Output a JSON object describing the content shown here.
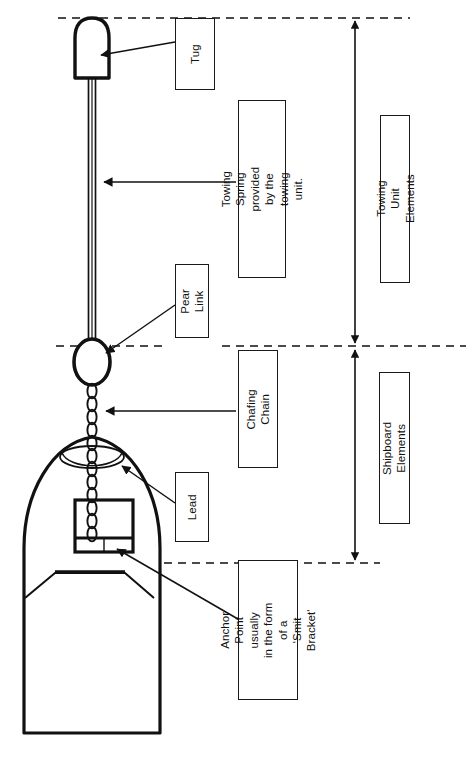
{
  "diagram": {
    "stroke_color": "#111111",
    "background_color": "#ffffff"
  },
  "labels": {
    "tug": "Tug",
    "towing_spring": "Towing Spring provided\nby the towing unit.",
    "towing_unit_elements": "Towing Unit Elements",
    "pear_link": "Pear Link",
    "chafing_chain": "Chafing\nChain",
    "shipboard_elements": "Shipboard Elements",
    "lead": "Lead",
    "anchor_point": "Anchor Point usually\nin the form of a\n'Smit Bracket'"
  },
  "parts": {
    "tug_hull": "tug-hull-shape",
    "towing_spring_line": "towing-spring-rope",
    "pear_link_ring": "pear-link-ellipse",
    "chafing_chain_links": "chain-link-run",
    "lead_fairlead": "bow-lead-fairlead",
    "smit_bracket": "smit-bracket-box",
    "ship_hull": "ship-bow-hull-outline",
    "ship_superstructure": "ship-deck-trapezoid"
  },
  "guides": {
    "top_dashed_y": 18,
    "middle_dashed_y": 346,
    "bottom_dashed_y": 563,
    "bracket_arrow_x": 355
  }
}
